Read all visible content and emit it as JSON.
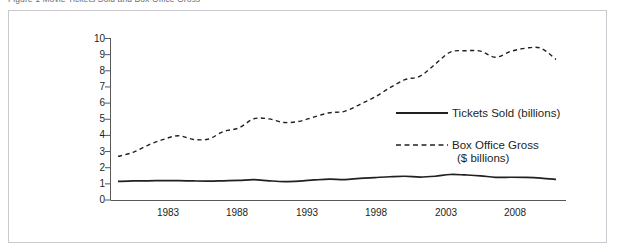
{
  "caption": {
    "text": "Figure 1 Movie Tickets Sold and Box Office Gross"
  },
  "legend": {
    "tickets_label": "Tickets Sold (billions)",
    "gross_label_line1": "Box Office Gross",
    "gross_label_line2": "($ billions)"
  },
  "colors": {
    "line": "#231f20",
    "border": "#c9c9cf",
    "axis": "#58585b",
    "text": "#231f20",
    "background": "#ffffff"
  },
  "chart_data": {
    "type": "line",
    "title": "Movie Tickets Sold and Box Office Gross",
    "xlabel": "",
    "ylabel": "",
    "xlim": [
      1980,
      2009
    ],
    "ylim": [
      0,
      10
    ],
    "grid": false,
    "legend_position": "right-center",
    "ytick_labels": [
      "0",
      "1",
      "2",
      "3",
      "4",
      "5",
      "6",
      "7",
      "8",
      "9",
      "10"
    ],
    "ytick_values": [
      0,
      1,
      2,
      3,
      4,
      5,
      6,
      7,
      8,
      9,
      10
    ],
    "xtick_labels": [
      "1983",
      "1988",
      "1993",
      "1998",
      "2003",
      "2008"
    ],
    "xtick_values": [
      1983,
      1988,
      1993,
      1998,
      2003,
      2008
    ],
    "x": [
      1980,
      1981,
      1982,
      1983,
      1984,
      1985,
      1986,
      1987,
      1988,
      1989,
      1990,
      1991,
      1992,
      1993,
      1994,
      1995,
      1996,
      1997,
      1998,
      1999,
      2000,
      2001,
      2002,
      2003,
      2004,
      2005,
      2006,
      2007,
      2008,
      2009
    ],
    "series": [
      {
        "name": "Tickets Sold (billions)",
        "style": "solid",
        "values": [
          1.15,
          1.18,
          1.19,
          1.2,
          1.2,
          1.18,
          1.17,
          1.19,
          1.21,
          1.26,
          1.19,
          1.14,
          1.17,
          1.24,
          1.29,
          1.26,
          1.34,
          1.39,
          1.44,
          1.47,
          1.42,
          1.47,
          1.58,
          1.55,
          1.5,
          1.4,
          1.41,
          1.4,
          1.36,
          1.28
        ]
      },
      {
        "name": "Box Office Gross ($ billions)",
        "style": "dashed",
        "values": [
          2.7,
          2.95,
          3.4,
          3.75,
          3.98,
          3.75,
          3.78,
          4.25,
          4.46,
          5.03,
          5.02,
          4.8,
          4.87,
          5.15,
          5.4,
          5.49,
          5.91,
          6.37,
          6.95,
          7.45,
          7.67,
          8.41,
          9.16,
          9.24,
          9.22,
          8.84,
          9.2,
          9.4,
          9.4,
          8.7
        ]
      }
    ]
  }
}
